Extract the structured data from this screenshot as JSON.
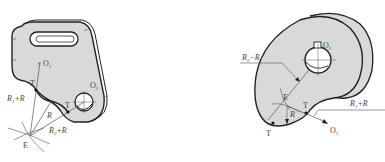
{
  "figure": {
    "type": "engineering-drawing",
    "colors": {
      "fill": "#d9d9d9",
      "stroke": "#222222",
      "thin": "#555555",
      "label": "#444444",
      "background": "#ffffff"
    }
  },
  "left_diagram": {
    "name": "bracket-plate-with-slot",
    "labels": {
      "o1": "O",
      "o1_sub": "1",
      "o2": "O",
      "o2_sub": "2",
      "t_upper": "T",
      "t_lower": "T",
      "e": "E",
      "r_sum1_a": "R",
      "r_sum1_sub": "1",
      "r_sum1_b": "+R",
      "r": "R",
      "r_sum2_a": "R",
      "r_sum2_sub": "2",
      "r_sum2_b": "+R"
    }
  },
  "right_diagram": {
    "name": "cam-disc-with-keyed-bore",
    "labels": {
      "o2": "O",
      "o2_sub": "2",
      "o1": "O",
      "o1_sub": "1",
      "e": "E",
      "t_left": "T",
      "t_right": "T",
      "r": "R",
      "r_diff_a": "R",
      "r_diff_sub": "2",
      "r_diff_b": "−R",
      "r_sum_a": "R",
      "r_sum_sub": "1",
      "r_sum_b": "+R"
    }
  }
}
